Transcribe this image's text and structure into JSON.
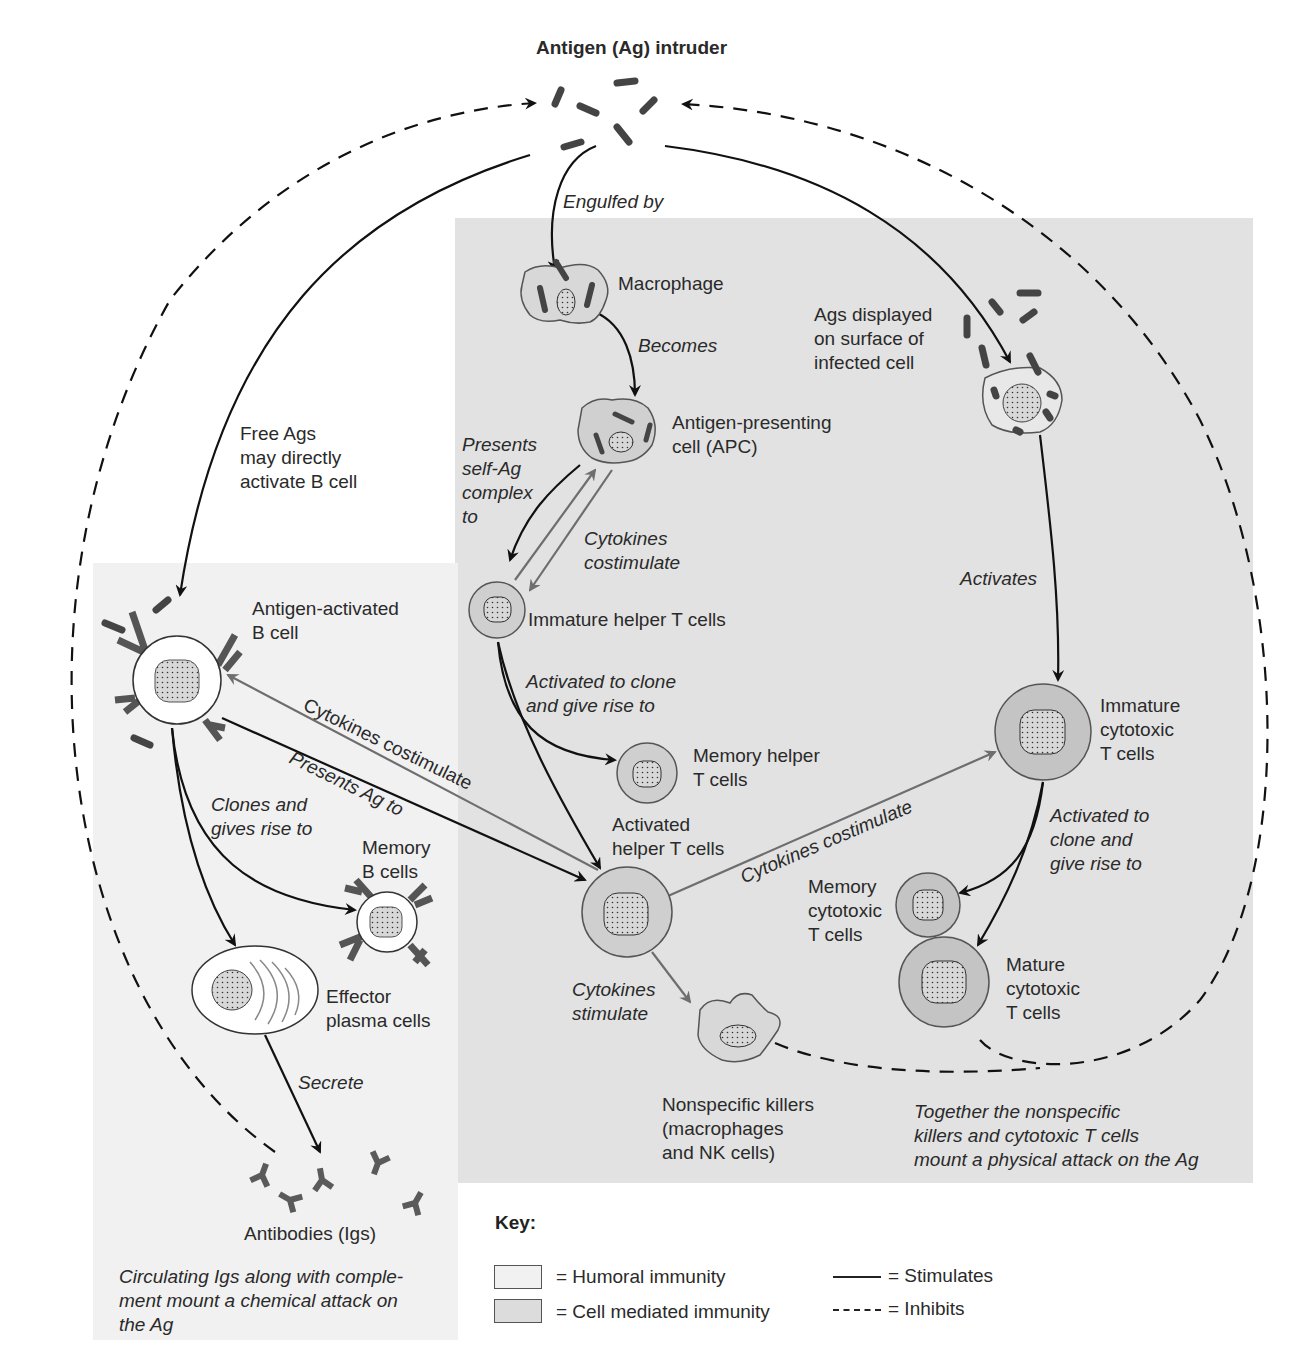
{
  "title": "Antigen (Ag) intruder",
  "regions": {
    "humoral": {
      "label": "Humoral immunity",
      "color": "#f1f1f1"
    },
    "cell_mediated": {
      "label": "Cell mediated immunity",
      "color": "#e2e2e2"
    }
  },
  "nodes": {
    "macrophage": "Macrophage",
    "apc_line1": "Antigen-presenting",
    "apc_line2": "cell (APC)",
    "infected_line1": "Ags displayed",
    "infected_line2": "on surface of",
    "infected_line3": "infected cell",
    "free_ags_line1": "Free Ags",
    "free_ags_line2": "may directly",
    "free_ags_line3": "activate B cell",
    "b_cell_line1": "Antigen-activated",
    "b_cell_line2": "B cell",
    "immature_helper": "Immature helper T cells",
    "memory_helper_line1": "Memory helper",
    "memory_helper_line2": "T cells",
    "activated_helper_line1": "Activated",
    "activated_helper_line2": "helper T cells",
    "immature_cyto_line1": "Immature",
    "immature_cyto_line2": "cytotoxic",
    "immature_cyto_line3": "T cells",
    "memory_cyto_line1": "Memory",
    "memory_cyto_line2": "cytotoxic",
    "memory_cyto_line3": "T cells",
    "mature_cyto_line1": "Mature",
    "mature_cyto_line2": "cytotoxic",
    "mature_cyto_line3": "T cells",
    "memory_b_line1": "Memory",
    "memory_b_line2": "B cells",
    "plasma_line1": "Effector",
    "plasma_line2": "plasma cells",
    "antibodies": "Antibodies (Igs)",
    "nk_line1": "Nonspecific killers",
    "nk_line2": "(macrophages",
    "nk_line3": "and NK cells)"
  },
  "edges": {
    "engulfed_by": "Engulfed by",
    "becomes": "Becomes",
    "presents_self_line1": "Presents",
    "presents_self_line2": "self-Ag",
    "presents_self_line3": "complex",
    "presents_self_line4": "to",
    "cytokines_costim_apc_line1": "Cytokines",
    "cytokines_costim_apc_line2": "costimulate",
    "activates": "Activates",
    "activated_clone_helper_line1": "Activated to clone",
    "activated_clone_helper_line2": "and give rise to",
    "cytokines_costim_b": "Cytokines costimulate",
    "presents_ag_to": "Presents Ag to",
    "clones_line1": "Clones and",
    "clones_line2": "gives rise to",
    "cytokines_costim_cyto": "Cytokines costimulate",
    "activated_clone_cyto_line1": "Activated to",
    "activated_clone_cyto_line2": "clone and",
    "activated_clone_cyto_line3": "give rise to",
    "cytokines_stimulate_line1": "Cytokines",
    "cytokines_stimulate_line2": "stimulate",
    "secrete": "Secrete"
  },
  "notes": {
    "chemical_line1": "Circulating Igs along with comple-",
    "chemical_line2": "ment mount a chemical attack on",
    "chemical_line3": "the Ag",
    "physical_line1": "Together the nonspecific",
    "physical_line2": "killers and cytotoxic T cells",
    "physical_line3": "mount a physical attack on the Ag"
  },
  "key": {
    "title": "Key:",
    "humoral": "= Humoral immunity",
    "cell_mediated": "= Cell mediated immunity",
    "stimulates": "= Stimulates",
    "inhibits": "= Inhibits"
  },
  "colors": {
    "stimulate_line": "#111111",
    "costimulate_line": "#6e6e6e",
    "cell_fill": "#c8c8c8",
    "antigen": "#4a4a4a"
  }
}
